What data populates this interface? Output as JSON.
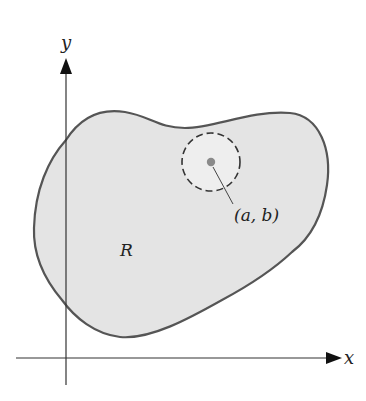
{
  "figure": {
    "region": {
      "label": "R",
      "fill_color": "#e4e4e4",
      "stroke_color": "#555555"
    },
    "axes": {
      "x_label": "x",
      "y_label": "y",
      "color": "#333333"
    },
    "point": {
      "label": "(a, b)",
      "dot_color": "#8a8a8a",
      "neighborhood_style": "dashed-circle",
      "neighborhood_fill": "#eeeeee"
    }
  }
}
